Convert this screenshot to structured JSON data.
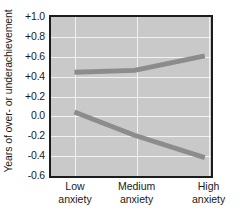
{
  "chart_data": {
    "type": "line",
    "title": "",
    "xlabel": "",
    "ylabel": "Years of over- or underachievement",
    "categories": [
      "Low anxiety",
      "Medium anxiety",
      "High anxiety"
    ],
    "category_lines": [
      [
        "Low",
        "anxiety"
      ],
      [
        "Medium",
        "anxiety"
      ],
      [
        "High",
        "anxiety"
      ]
    ],
    "x": [
      0,
      1,
      2
    ],
    "ylim": [
      -0.6,
      1.0
    ],
    "ytick_values": [
      1.0,
      0.8,
      0.6,
      0.4,
      0.2,
      0.0,
      -0.2,
      -0.4,
      -0.6
    ],
    "ytick_labels": [
      "+1.0",
      "+0.8",
      "+0.6",
      "+0.4",
      "+0.2",
      "0.0",
      "-0.2",
      "-0.4",
      "-0.6"
    ],
    "grid": true,
    "grid_color": "#f2f2f2",
    "legend": "none",
    "plot_background": "#c9c9c9",
    "line_color": "#8c8c8c",
    "line_width": 5,
    "series": [
      {
        "name": "upper-series",
        "values": [
          0.43,
          0.45,
          0.6
        ]
      },
      {
        "name": "lower-series",
        "values": [
          0.02,
          -0.22,
          -0.45
        ]
      }
    ]
  }
}
